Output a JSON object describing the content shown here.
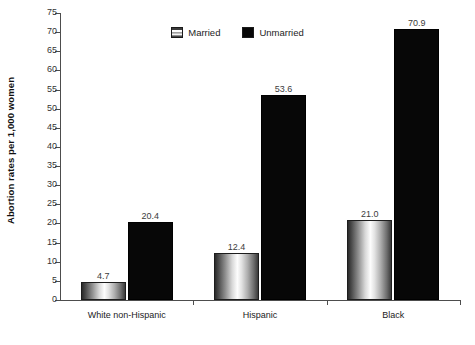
{
  "chart_data": {
    "type": "bar",
    "title": "",
    "subtitle": "",
    "xlabel": "",
    "ylabel": "Abortion rates per 1,000 women",
    "categories": [
      "White non-Hispanic",
      "Hispanic",
      "Black"
    ],
    "series": [
      {
        "name": "Married",
        "values": [
          4.7,
          12.4,
          21.0
        ],
        "color": "#c9c9c9",
        "fill": "gray-cylinder-gradient"
      },
      {
        "name": "Unmarried",
        "values": [
          20.4,
          53.6,
          70.9
        ],
        "color": "#070707",
        "fill": "solid-black"
      }
    ],
    "value_labels": [
      [
        "4.7",
        "20.4"
      ],
      [
        "12.4",
        "53.6"
      ],
      [
        "21.0",
        "70.9"
      ]
    ],
    "ylim": [
      0,
      75
    ],
    "ytick_step": 5,
    "yticks": [
      0,
      5,
      10,
      15,
      20,
      25,
      30,
      35,
      40,
      45,
      50,
      55,
      60,
      65,
      70,
      75
    ],
    "ytick_labels": [
      "0",
      "5",
      "10",
      "15",
      "20",
      "25",
      "30",
      "35",
      "40",
      "45",
      "50",
      "55",
      "60",
      "65",
      "70",
      "75"
    ],
    "grid": false,
    "legend_position": "top-center",
    "legend_entries": [
      "Married",
      "Unmarried"
    ],
    "annotations": []
  },
  "axis": {
    "y_title": "Abortion rates per 1,000 women",
    "line_color": "#4d4d4d"
  },
  "legend": {
    "items": [
      {
        "label": "Married",
        "swatch": "married-swatch"
      },
      {
        "label": "Unmarried",
        "swatch": "unmarried-swatch"
      }
    ]
  },
  "caption": {
    "remnant": ""
  }
}
